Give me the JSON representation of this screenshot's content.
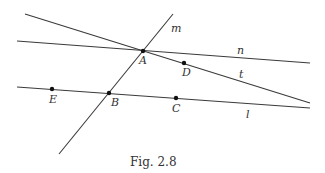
{
  "figure": {
    "caption": "Fig. 2.8",
    "lines": [
      {
        "id": "m",
        "label": "m",
        "x1": 59,
        "y1": 154,
        "x2": 173,
        "y2": 14,
        "label_x": 171,
        "label_y": 32
      },
      {
        "id": "n",
        "label": "n",
        "x1": 17,
        "y1": 41,
        "x2": 310,
        "y2": 63,
        "label_x": 237,
        "label_y": 54
      },
      {
        "id": "t",
        "label": "t",
        "x1": 25,
        "y1": 14,
        "x2": 310,
        "y2": 103,
        "label_x": 239,
        "label_y": 78
      },
      {
        "id": "l",
        "label": "l",
        "x1": 17,
        "y1": 87,
        "x2": 310,
        "y2": 108,
        "label_x": 246,
        "label_y": 118
      }
    ],
    "points": [
      {
        "id": "A",
        "label": "A",
        "x": 143,
        "y": 51,
        "label_x": 139,
        "label_y": 64
      },
      {
        "id": "D",
        "label": "D",
        "x": 184,
        "y": 63,
        "label_x": 182,
        "label_y": 76
      },
      {
        "id": "E",
        "label": "E",
        "x": 52,
        "y": 89,
        "label_x": 49,
        "label_y": 103
      },
      {
        "id": "B",
        "label": "B",
        "x": 109,
        "y": 93,
        "label_x": 111,
        "label_y": 106
      },
      {
        "id": "C",
        "label": "C",
        "x": 176,
        "y": 98,
        "label_x": 172,
        "label_y": 112
      }
    ],
    "colors": {
      "line": "#3a3a3a",
      "point": "#111111",
      "text": "#333333"
    }
  }
}
